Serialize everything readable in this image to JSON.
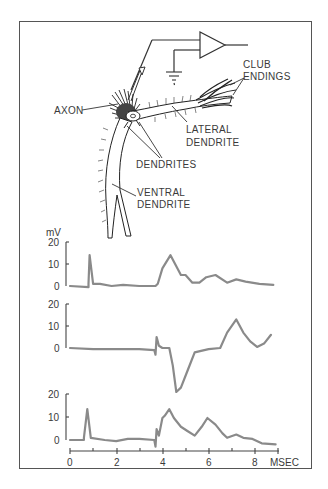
{
  "diagram": {
    "labels": {
      "club_endings_1": "CLUB",
      "club_endings_2": "ENDINGS",
      "axon": "AXON",
      "lateral_1": "LATERAL",
      "lateral_2": "DENDRITE",
      "dendrites": "DENDRITES",
      "ventral_1": "VENTRAL",
      "ventral_2": "DENDRITE"
    },
    "components": [
      "amplifier-icon",
      "ground-icon",
      "electrode",
      "neuron"
    ]
  },
  "chart_data": {
    "type": "line",
    "title": "",
    "xlabel": "MSEC",
    "ylabel": "mV",
    "x_ticks": [
      "0",
      "2",
      "4",
      "6",
      "8"
    ],
    "xlim": [
      0,
      9
    ],
    "grid": false,
    "panels": [
      {
        "name": "trace-1",
        "y_ticks": [
          "0",
          "10",
          "20"
        ],
        "ylim": [
          0,
          20
        ],
        "x": [
          0,
          0.8,
          0.8,
          0.85,
          1.0,
          1.3,
          1.8,
          2.3,
          3.0,
          3.7,
          3.8,
          4.0,
          4.35,
          4.6,
          4.8,
          5.0,
          5.3,
          5.6,
          5.9,
          6.3,
          6.8,
          7.2,
          7.6,
          8.2,
          8.8
        ],
        "values": [
          0,
          -0.5,
          1,
          14,
          1,
          1,
          0,
          0.5,
          0,
          0,
          1,
          8,
          14,
          9,
          5,
          5,
          1.5,
          1.5,
          4,
          5,
          1.5,
          3,
          2,
          1,
          0.5
        ]
      },
      {
        "name": "trace-2",
        "y_ticks": [
          "0",
          "10",
          "20"
        ],
        "ylim": [
          -20,
          20
        ],
        "x": [
          0,
          1,
          2,
          3,
          3.65,
          3.7,
          3.75,
          3.85,
          4.0,
          4.3,
          4.45,
          4.6,
          4.8,
          5.1,
          5.4,
          6.0,
          6.5,
          6.8,
          7.2,
          7.5,
          7.8,
          8.1,
          8.4,
          8.7
        ],
        "values": [
          0,
          -0.5,
          -0.5,
          -0.5,
          -1,
          -3,
          5,
          1,
          0,
          0,
          -8,
          -20,
          -18,
          -10,
          -2,
          -0.5,
          0,
          7,
          13,
          7,
          3,
          0.5,
          2,
          6
        ]
      },
      {
        "name": "trace-3",
        "y_ticks": [
          "0",
          "10",
          "20"
        ],
        "ylim": [
          0,
          20
        ],
        "x": [
          0,
          0.6,
          0.6,
          0.75,
          0.9,
          1.5,
          2.0,
          2.5,
          3.0,
          3.65,
          3.7,
          3.75,
          3.85,
          4.0,
          4.1,
          4.3,
          4.5,
          4.8,
          5.1,
          5.4,
          5.7,
          5.95,
          6.3,
          6.6,
          6.8,
          7.2,
          7.5,
          7.9,
          8.3,
          8.9
        ],
        "values": [
          0,
          0,
          1,
          14,
          1,
          0,
          -0.5,
          0.5,
          0.5,
          0,
          -3,
          5,
          2,
          10,
          11,
          14,
          10,
          6,
          4,
          2,
          6,
          10,
          7,
          3,
          1,
          2.5,
          1,
          0.5,
          -1.5,
          -2
        ]
      }
    ],
    "axis_label": "MSEC",
    "unit_label": "mV"
  }
}
